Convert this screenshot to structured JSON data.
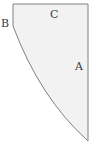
{
  "figure": {
    "type": "geometric-shape",
    "fill_color": "#f2f2f2",
    "stroke_color": "#808080",
    "background_color": "#ffffff",
    "canvas": {
      "width": 96,
      "height": 144
    },
    "labels": {
      "a": "A",
      "b": "B",
      "c": "C"
    },
    "label_positions": {
      "a": {
        "x": 79,
        "y": 67,
        "placement": "inside-right"
      },
      "b": {
        "x": 5,
        "y": 24,
        "placement": "outside-left"
      },
      "c": {
        "x": 54,
        "y": 15,
        "placement": "inside-top"
      }
    },
    "geometry": {
      "top_edge_y": 4,
      "left_edge_x": 13,
      "right_edge_x": 88,
      "left_vertex": {
        "x": 13,
        "y": 26
      },
      "top_left_corner": {
        "x": 13,
        "y": 4
      },
      "top_right_corner": {
        "x": 88,
        "y": 4
      },
      "bottom_apex": {
        "x": 88,
        "y": 141
      },
      "arc_control_point": {
        "x": 40,
        "y": 98
      },
      "arc_path": "M 13 26 Q 40 98 88 141"
    },
    "stroke_width": 1
  }
}
